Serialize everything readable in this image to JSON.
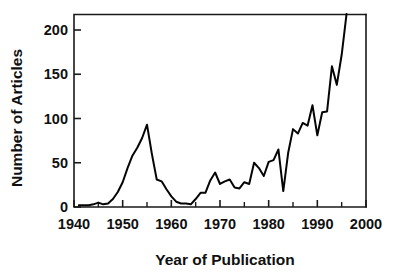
{
  "chart_data": {
    "type": "line",
    "title": "",
    "xlabel": "Year  of Publication",
    "ylabel": "Number of Articles",
    "xlim": [
      1940,
      2000
    ],
    "ylim": [
      0,
      220
    ],
    "grid": false,
    "legend": null,
    "x_ticks": [
      1940,
      1950,
      1960,
      1970,
      1980,
      1990,
      2000
    ],
    "x_tick_labels": [
      "1940",
      "1950",
      "1960",
      "1970",
      "1980",
      "1990",
      "2000"
    ],
    "x_minor_ticks": [
      1945,
      1955,
      1965,
      1975,
      1985,
      1995
    ],
    "y_ticks": [
      0,
      50,
      100,
      150,
      200
    ],
    "y_tick_labels": [
      "0",
      "50",
      "100",
      "150",
      "200"
    ],
    "series": [
      {
        "name": "Number of Articles",
        "color": "#050505",
        "x": [
          1941,
          1942,
          1943,
          1944,
          1945,
          1946,
          1947,
          1948,
          1949,
          1950,
          1951,
          1952,
          1953,
          1954,
          1955,
          1956,
          1957,
          1958,
          1959,
          1960,
          1961,
          1962,
          1963,
          1964,
          1965,
          1966,
          1967,
          1968,
          1969,
          1970,
          1971,
          1972,
          1973,
          1974,
          1975,
          1976,
          1977,
          1978,
          1979,
          1980,
          1981,
          1982,
          1983,
          1984,
          1985,
          1986,
          1987,
          1988,
          1989,
          1990,
          1991,
          1992,
          1993,
          1994,
          1995,
          1996
        ],
        "values": [
          2,
          2,
          2,
          3,
          5,
          3,
          4,
          9,
          17,
          28,
          44,
          58,
          67,
          78,
          93,
          60,
          31,
          29,
          20,
          12,
          6,
          4,
          4,
          3,
          9,
          16,
          16,
          30,
          39,
          26,
          29,
          31,
          22,
          21,
          28,
          26,
          50,
          44,
          35,
          51,
          53,
          65,
          18,
          61,
          88,
          83,
          95,
          92,
          115,
          81,
          107,
          108,
          159,
          138,
          172,
          218
        ]
      }
    ]
  },
  "labels": {
    "x_axis_title": "Year  of Publication",
    "y_axis_title": "Number of Articles"
  }
}
